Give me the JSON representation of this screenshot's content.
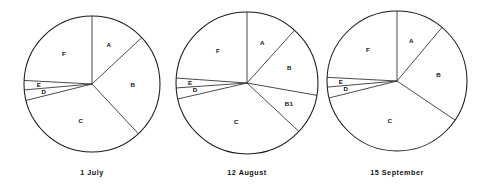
{
  "figure": {
    "background_color": "#ffffff",
    "line_color": "#1a1a1a",
    "label_color": "#111111",
    "width": 490,
    "height": 193
  },
  "chart_data": [
    {
      "type": "pie",
      "title": "1 July",
      "caption": "1 July",
      "center_x": 92,
      "center_y": 84,
      "radius": 68,
      "start_angle_deg": 0,
      "direction": "clockwise",
      "grid": false,
      "legend": "none",
      "labels_inside": true,
      "categories": [
        "A",
        "B",
        "C",
        "D",
        "E",
        "F"
      ],
      "boundaries_deg": [
        0,
        47,
        137,
        256,
        265,
        273,
        360
      ],
      "values": [
        13.1,
        25.0,
        33.1,
        2.5,
        2.2,
        24.1
      ],
      "slices": [
        {
          "label": "A",
          "start_deg": 0,
          "end_deg": 47,
          "sweep_deg": 47,
          "percent": 13.1,
          "label_r_frac": 0.62
        },
        {
          "label": "B",
          "start_deg": 47,
          "end_deg": 137,
          "sweep_deg": 90,
          "percent": 25.0,
          "label_r_frac": 0.6
        },
        {
          "label": "C",
          "start_deg": 137,
          "end_deg": 256,
          "sweep_deg": 119,
          "percent": 33.1,
          "label_r_frac": 0.58
        },
        {
          "label": "D",
          "start_deg": 256,
          "end_deg": 265,
          "sweep_deg": 9,
          "percent": 2.5,
          "label_r_frac": 0.72
        },
        {
          "label": "E",
          "start_deg": 265,
          "end_deg": 273,
          "sweep_deg": 8,
          "percent": 2.2,
          "label_r_frac": 0.78
        },
        {
          "label": "F",
          "start_deg": 273,
          "end_deg": 360,
          "sweep_deg": 87,
          "percent": 24.1,
          "label_r_frac": 0.6
        }
      ]
    },
    {
      "type": "pie",
      "title": "12 August",
      "caption": "12 August",
      "center_x": 247,
      "center_y": 83,
      "radius": 71,
      "start_angle_deg": 0,
      "direction": "clockwise",
      "grid": false,
      "legend": "none",
      "labels_inside": true,
      "categories": [
        "A",
        "B",
        "B1",
        "C",
        "D",
        "E",
        "F"
      ],
      "boundaries_deg": [
        0,
        42,
        100,
        133,
        257,
        266,
        274,
        360
      ],
      "values": [
        11.7,
        16.1,
        9.2,
        34.4,
        2.5,
        2.2,
        23.9
      ],
      "slices": [
        {
          "label": "A",
          "start_deg": 0,
          "end_deg": 42,
          "sweep_deg": 42,
          "percent": 11.7,
          "label_r_frac": 0.6
        },
        {
          "label": "B",
          "start_deg": 42,
          "end_deg": 100,
          "sweep_deg": 58,
          "percent": 16.1,
          "label_r_frac": 0.63
        },
        {
          "label": "B1",
          "start_deg": 100,
          "end_deg": 133,
          "sweep_deg": 33,
          "percent": 9.2,
          "label_r_frac": 0.66
        },
        {
          "label": "C",
          "start_deg": 133,
          "end_deg": 257,
          "sweep_deg": 124,
          "percent": 34.4,
          "label_r_frac": 0.58
        },
        {
          "label": "D",
          "start_deg": 257,
          "end_deg": 266,
          "sweep_deg": 9,
          "percent": 2.5,
          "label_r_frac": 0.74
        },
        {
          "label": "E",
          "start_deg": 266,
          "end_deg": 274,
          "sweep_deg": 8,
          "percent": 2.2,
          "label_r_frac": 0.8
        },
        {
          "label": "F",
          "start_deg": 274,
          "end_deg": 360,
          "sweep_deg": 86,
          "percent": 23.9,
          "label_r_frac": 0.6
        }
      ]
    },
    {
      "type": "pie",
      "title": "15 September",
      "caption": "15 September",
      "center_x": 397,
      "center_y": 81,
      "radius": 70,
      "start_angle_deg": 0,
      "direction": "clockwise",
      "grid": false,
      "legend": "none",
      "labels_inside": true,
      "categories": [
        "A",
        "B",
        "C",
        "D",
        "E",
        "F"
      ],
      "boundaries_deg": [
        0,
        40,
        124,
        256,
        265,
        273,
        360
      ],
      "values": [
        11.1,
        23.3,
        36.7,
        2.5,
        2.2,
        24.2
      ],
      "slices": [
        {
          "label": "A",
          "start_deg": 0,
          "end_deg": 40,
          "sweep_deg": 40,
          "percent": 11.1,
          "label_r_frac": 0.6
        },
        {
          "label": "B",
          "start_deg": 40,
          "end_deg": 124,
          "sweep_deg": 84,
          "percent": 23.3,
          "label_r_frac": 0.6
        },
        {
          "label": "C",
          "start_deg": 124,
          "end_deg": 256,
          "sweep_deg": 132,
          "percent": 36.7,
          "label_r_frac": 0.58
        },
        {
          "label": "D",
          "start_deg": 256,
          "end_deg": 265,
          "sweep_deg": 9,
          "percent": 2.5,
          "label_r_frac": 0.74
        },
        {
          "label": "E",
          "start_deg": 265,
          "end_deg": 273,
          "sweep_deg": 8,
          "percent": 2.2,
          "label_r_frac": 0.8
        },
        {
          "label": "F",
          "start_deg": 273,
          "end_deg": 360,
          "sweep_deg": 87,
          "percent": 24.2,
          "label_r_frac": 0.6
        }
      ]
    }
  ],
  "captions": {
    "chart_1": "1 July",
    "chart_2": "12 August",
    "chart_3": "15 September"
  },
  "caption_y": 168
}
